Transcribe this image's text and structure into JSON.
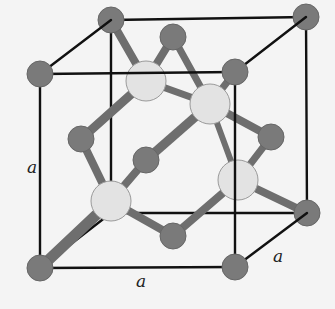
{
  "diagram": {
    "colors": {
      "background": "#f4f4f4",
      "cube_edge": "#111111",
      "lattice_atom": "#7a7a7a",
      "lattice_atom_stroke": "#666666",
      "tetrahedral_atom": "#e3e3e3",
      "tetrahedral_atom_stroke": "#9a9a9a",
      "bond": "#6e6e6e"
    },
    "labels": {
      "left_edge": "a",
      "bottom_edge": "a",
      "depth_edge": "a"
    },
    "cube": {
      "front_top_left": [
        40,
        74
      ],
      "front_top_right": [
        235,
        72
      ],
      "front_bottom_left": [
        40,
        268
      ],
      "front_bottom_right": [
        235,
        267
      ],
      "back_top_left": [
        111,
        20
      ],
      "back_top_right": [
        306,
        17
      ],
      "back_bottom_left": [
        111,
        213
      ],
      "back_bottom_right": [
        307,
        213
      ]
    },
    "lattice_atoms": [
      {
        "id": "corner-back-top-left",
        "x": 111,
        "y": 20
      },
      {
        "id": "corner-back-top-right",
        "x": 306,
        "y": 17
      },
      {
        "id": "corner-front-top-left",
        "x": 40,
        "y": 74
      },
      {
        "id": "corner-front-top-right",
        "x": 235,
        "y": 72
      },
      {
        "id": "corner-front-bottom-left",
        "x": 40,
        "y": 268
      },
      {
        "id": "corner-front-bottom-right",
        "x": 235,
        "y": 267
      },
      {
        "id": "corner-back-bottom-right",
        "x": 307,
        "y": 213
      },
      {
        "id": "face-top",
        "x": 173,
        "y": 37
      },
      {
        "id": "face-left",
        "x": 81,
        "y": 139
      },
      {
        "id": "face-center-front",
        "x": 146,
        "y": 160
      },
      {
        "id": "face-right",
        "x": 271,
        "y": 137
      },
      {
        "id": "face-bottom",
        "x": 173,
        "y": 236
      }
    ],
    "tetrahedral_atoms": [
      {
        "id": "tetra-1",
        "x": 146,
        "y": 81
      },
      {
        "id": "tetra-2",
        "x": 210,
        "y": 104
      },
      {
        "id": "tetra-3",
        "x": 111,
        "y": 201
      },
      {
        "id": "tetra-4",
        "x": 238,
        "y": 180
      }
    ]
  }
}
